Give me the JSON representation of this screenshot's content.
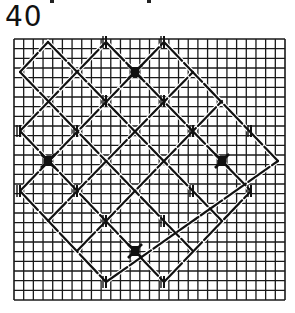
{
  "figure": {
    "number": "40",
    "type": "couched lattice stitch pattern on canvas grid"
  },
  "grid": {
    "x0": 14,
    "y0": 39,
    "x1": 285,
    "y1": 300,
    "cols": 28,
    "rows": 27,
    "line_color": "#1a1a1a"
  },
  "lattice": {
    "col_x": [
      20,
      48,
      77,
      106,
      135,
      164,
      193,
      222,
      251,
      278
    ],
    "row_y": [
      42,
      72,
      101,
      131,
      161,
      191,
      221,
      251,
      282
    ],
    "line_color": "#111111",
    "back_lines": [
      [
        [
          1,
          0
        ],
        [
          7,
          6
        ]
      ],
      [
        [
          3,
          0
        ],
        [
          8,
          5
        ]
      ],
      [
        [
          5,
          0
        ],
        [
          9,
          4
        ]
      ],
      [
        [
          0,
          1
        ],
        [
          6,
          7
        ]
      ],
      [
        [
          0,
          3
        ],
        [
          5,
          8
        ]
      ],
      [
        [
          0,
          5
        ],
        [
          3,
          8
        ]
      ]
    ],
    "fwd_lines": [
      [
        [
          0,
          1
        ],
        [
          1,
          0
        ]
      ],
      [
        [
          0,
          3
        ],
        [
          3,
          0
        ]
      ],
      [
        [
          0,
          5
        ],
        [
          5,
          0
        ]
      ],
      [
        [
          1,
          6
        ],
        [
          6,
          1
        ]
      ],
      [
        [
          3,
          8
        ],
        [
          9,
          4
        ]
      ],
      [
        [
          2,
          7
        ],
        [
          7,
          2
        ]
      ],
      [
        [
          5,
          8
        ],
        [
          8,
          5
        ]
      ]
    ],
    "dark_crosses": [
      [
        4,
        1
      ],
      [
        1,
        4
      ],
      [
        7,
        4
      ],
      [
        4,
        7
      ]
    ],
    "tick_marks": [
      [
        3,
        0
      ],
      [
        5,
        0
      ],
      [
        3,
        2
      ],
      [
        5,
        2
      ],
      [
        0,
        3
      ],
      [
        2,
        3
      ],
      [
        6,
        3
      ],
      [
        8,
        3
      ],
      [
        0,
        5
      ],
      [
        2,
        5
      ],
      [
        6,
        5
      ],
      [
        8,
        5
      ],
      [
        3,
        6
      ],
      [
        5,
        6
      ],
      [
        3,
        8
      ],
      [
        5,
        8
      ]
    ]
  }
}
